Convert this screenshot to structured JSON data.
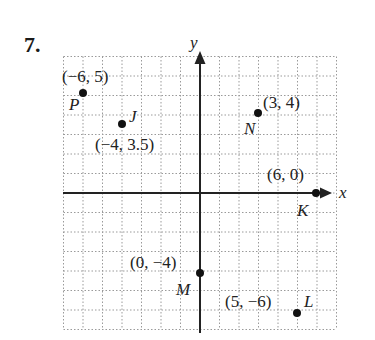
{
  "problem_number": "7.",
  "axes": {
    "x_label": "x",
    "y_label": "y",
    "x_range": [
      -7,
      7
    ],
    "y_range": [
      -7,
      7
    ],
    "grid": true
  },
  "points": [
    {
      "name": "P",
      "x": -6,
      "y": 5,
      "coord_label": "(−6, 5)"
    },
    {
      "name": "J",
      "x": -4,
      "y": 3.5,
      "coord_label": "(−4, 3.5)"
    },
    {
      "name": "N",
      "x": 3,
      "y": 4,
      "coord_label": "(3, 4)"
    },
    {
      "name": "K",
      "x": 6,
      "y": 0,
      "coord_label": "(6, 0)"
    },
    {
      "name": "M",
      "x": 0,
      "y": -4,
      "coord_label": "(0, −4)"
    },
    {
      "name": "L",
      "x": 5,
      "y": -6,
      "coord_label": "(5, −6)"
    }
  ],
  "colors": {
    "axis": "#222222",
    "grid": "#9a9a9a",
    "point": "#111111"
  }
}
